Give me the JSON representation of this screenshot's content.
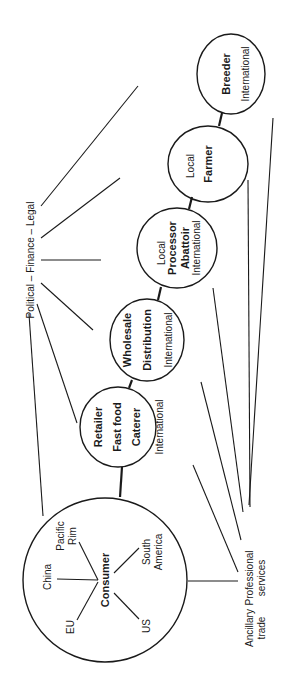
{
  "diagram": {
    "orientation": "rotated -90deg (text reads bottom-to-top)",
    "nodes": [
      {
        "id": "breeder",
        "labels": [
          "Breeder"
        ],
        "scope": [
          "International"
        ]
      },
      {
        "id": "farmer",
        "labels": [
          "Farmer"
        ],
        "scope": [
          "Local"
        ]
      },
      {
        "id": "processor",
        "labels": [
          "Processor",
          "Abattoir"
        ],
        "scope": [
          "Local",
          "International"
        ]
      },
      {
        "id": "wholesale",
        "labels": [
          "Wholesale",
          "Distribution"
        ],
        "scope": [
          "International"
        ]
      },
      {
        "id": "retailer",
        "labels": [
          "Retailer",
          "Fast food",
          "Caterer"
        ],
        "scope": [
          "International"
        ]
      },
      {
        "id": "consumer",
        "labels": [
          "Consumer"
        ],
        "markets": [
          "China",
          "Pacific Rim",
          "EU",
          "US",
          "South America"
        ]
      }
    ],
    "chain": [
      "breeder",
      "farmer",
      "processor",
      "wholesale",
      "retailer",
      "consumer"
    ],
    "external": {
      "political": "Political – Finance – Legal",
      "professional": [
        "Professional",
        "services"
      ],
      "ancillary": [
        "Ancillary",
        "trade"
      ]
    },
    "text": {
      "breeder": "Breeder",
      "breeder_scope": "International",
      "farmer": "Farmer",
      "farmer_scope": "Local",
      "processor_1": "Processor",
      "processor_2": "Abattoir",
      "processor_local": "Local",
      "processor_intl": "International",
      "wholesale_1": "Wholesale",
      "wholesale_2": "Distribution",
      "wholesale_intl": "International",
      "retailer_1": "Retailer",
      "retailer_2": "Fast food",
      "retailer_3": "Caterer",
      "retailer_intl": "International",
      "consumer": "Consumer",
      "china": "China",
      "pacific_1": "Pacific",
      "pacific_2": "Rim",
      "eu": "EU",
      "us": "US",
      "south_1": "South",
      "south_2": "America",
      "pfl": "Political – Finance – Legal",
      "prof_1": "Professional",
      "prof_2": "services",
      "anc_1": "Ancillary",
      "anc_2": "trade"
    }
  }
}
